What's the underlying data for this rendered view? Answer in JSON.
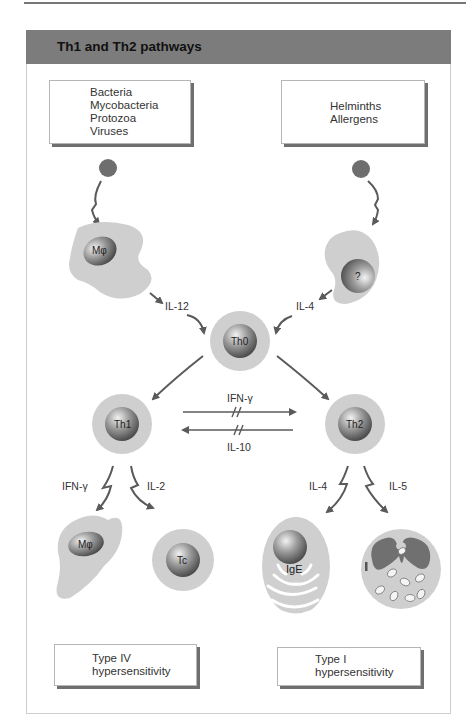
{
  "figure": {
    "title": "Th1 and Th2 pathways",
    "pathogen_boxes": {
      "left": [
        "Bacteria",
        "Mycobacteria",
        "Protozoa",
        "Viruses"
      ],
      "right": [
        "Helminths",
        "Allergens"
      ]
    },
    "cells": {
      "apc_left": "Mφ",
      "apc_right": "?",
      "th0": "Th0",
      "th1": "Th1",
      "th2": "Th2",
      "macrophage": "Mφ",
      "tc": "Tc",
      "plasma_cell": "IgE"
    },
    "cytokines": {
      "il12": "IL-12",
      "il4_top": "IL-4",
      "ifn_cross": "IFN-γ",
      "il10_cross": "IL-10",
      "ifn_th1": "IFN-γ",
      "il2": "IL-2",
      "il4_th2": "IL-4",
      "il5": "IL-5"
    },
    "outcome_boxes": {
      "left": [
        "Type IV",
        "hypersensitivity"
      ],
      "right": [
        "Type I",
        "hypersensitivity"
      ]
    },
    "colors": {
      "header": "#7c7c7c",
      "cell_fill": "#cfcfcf",
      "nucleus": "#8a8a8a",
      "pathogen": "#6e6e6e",
      "arrow": "#5a5a5a"
    }
  }
}
